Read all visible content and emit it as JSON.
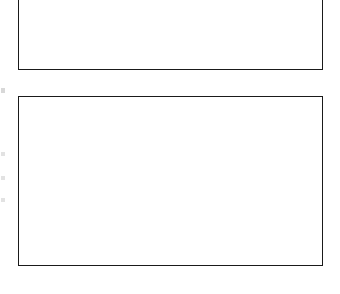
{
  "figure": {
    "top_chart": {
      "ylabel_visible": "40",
      "ygrid_values": [
        40
      ],
      "note": "upper panel is cropped by the top edge of the screenshot"
    },
    "main_chart": {
      "title": "Thousands of anchovies/km",
      "title_superscript": "2",
      "title_suffix": "/yr",
      "xlabel": "Years before A.D. 2000"
    }
  },
  "colors": {
    "bar_fill": "#9a9a9a",
    "frame": "#1a1a1a",
    "gridline": "#b3b3b3",
    "background": "#ffffff"
  },
  "chart_data": [
    {
      "id": "top-panel",
      "type": "bar",
      "title": "",
      "xlabel": "",
      "ylabel": "",
      "ylim": [
        0,
        120
      ],
      "ytick_values": [
        40
      ],
      "ytick_labels": [
        "40"
      ],
      "grid": true,
      "legend": null,
      "note": "Upper histogram panel, clipped at the top of the screenshot. Only the 40 gridline and the bar bases are visible.",
      "x": [
        55,
        110,
        165,
        220,
        275,
        330,
        385,
        440,
        495,
        550,
        605,
        660,
        715,
        770,
        825,
        880,
        935,
        990,
        1045,
        1100,
        1155,
        1210,
        1265,
        1320,
        1375,
        1430,
        1485,
        1540,
        1595,
        1650,
        1705,
        1760
      ],
      "values": [
        0,
        14,
        0,
        0,
        11,
        0,
        0,
        0,
        21,
        0,
        0,
        10,
        0,
        17,
        0,
        22,
        0,
        28,
        28,
        0,
        0,
        0,
        23,
        24,
        0,
        15,
        0,
        22,
        22,
        0,
        30,
        0
      ]
    },
    {
      "id": "main-panel",
      "type": "bar",
      "title": "Thousands of anchovies/km2/yr",
      "xlabel": "Years before A.D. 2000",
      "ylabel": "Thousands of anchovies/km2/yr",
      "xlim": [
        0,
        1800
      ],
      "ylim": [
        0,
        190
      ],
      "ytick_values": [
        40,
        80,
        120,
        160
      ],
      "ytick_labels": [
        "40",
        "80",
        "120",
        "160"
      ],
      "xtick_values": [
        200,
        400,
        600,
        800,
        1000,
        1200,
        1400,
        1600,
        1800
      ],
      "xtick_labels": [
        "200",
        "400",
        "600",
        "800",
        "1000",
        "1200",
        "1400",
        "1600",
        "1800"
      ],
      "grid": true,
      "legend": null,
      "bin_width": 55,
      "categories": [
        "0-55",
        "55-110",
        "110-165",
        "165-220",
        "220-275",
        "275-330",
        "330-385",
        "385-440",
        "440-495",
        "495-550",
        "550-605",
        "605-660",
        "660-715",
        "715-770",
        "770-825",
        "825-880",
        "880-935",
        "935-990",
        "990-1045",
        "1045-1100",
        "1100-1155",
        "1155-1210",
        "1210-1265",
        "1265-1320",
        "1320-1375",
        "1375-1430",
        "1430-1485",
        "1485-1540",
        "1540-1595",
        "1595-1650",
        "1650-1705",
        "1705-1760"
      ],
      "bin_starts": [
        0,
        55,
        110,
        165,
        220,
        275,
        330,
        385,
        440,
        495,
        550,
        605,
        660,
        715,
        770,
        825,
        880,
        935,
        990,
        1045,
        1100,
        1155,
        1210,
        1265,
        1320,
        1375,
        1430,
        1485,
        1540,
        1595,
        1650,
        1705
      ],
      "values": [
        31,
        31,
        26,
        26,
        43,
        47,
        76,
        71,
        84,
        98,
        92,
        107,
        137,
        116,
        105,
        98,
        147,
        183,
        93,
        86
      ]
    }
  ]
}
